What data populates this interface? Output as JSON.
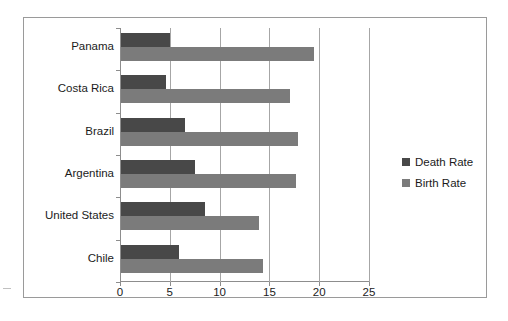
{
  "chart_data": {
    "type": "bar",
    "orientation": "horizontal",
    "title": "",
    "subtitle": "",
    "xlabel": "",
    "ylabel": "",
    "xlim": [
      0,
      25
    ],
    "xticks": [
      "0",
      "5",
      "10",
      "15",
      "20",
      "25"
    ],
    "xtick_values": [
      0,
      5,
      10,
      15,
      20,
      25
    ],
    "grid": "vertical",
    "legend_position": "right",
    "categories": [
      "Panama",
      "Costa Rica",
      "Brazil",
      "Argentina",
      "United States",
      "Chile"
    ],
    "series": [
      {
        "name": "Death Rate",
        "color": "#484848",
        "values": [
          4.9,
          4.5,
          6.4,
          7.4,
          8.4,
          5.8
        ]
      },
      {
        "name": "Birth Rate",
        "color": "#7b7b7b",
        "values": [
          19.4,
          17.0,
          17.8,
          17.6,
          13.9,
          14.3
        ]
      }
    ]
  },
  "legend": {
    "items": [
      {
        "label": "Death Rate",
        "color": "#484848"
      },
      {
        "label": "Birth Rate",
        "color": "#7b7b7b"
      }
    ]
  }
}
